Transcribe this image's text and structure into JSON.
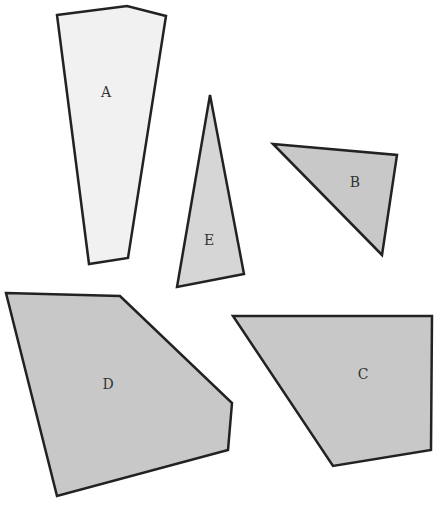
{
  "diagram": {
    "width": 434,
    "height": 509,
    "stroke_color": "#222222",
    "shapes": [
      {
        "label": "A",
        "fill": "#f1f1f1",
        "points": "57,15 127,6 166,16 128,258 89,264",
        "label_x": 106,
        "label_y": 97
      },
      {
        "label": "E",
        "fill": "#d6d6d6",
        "points": "210,95 244,274 177,287",
        "label_x": 209,
        "label_y": 245
      },
      {
        "label": "B",
        "fill": "#c8c8c8",
        "points": "273,144 397,155 382,255",
        "label_x": 355,
        "label_y": 187
      },
      {
        "label": "D",
        "fill": "#c8c8c8",
        "points": "6,293 120,296 232,403 228,450 57,496",
        "label_x": 108,
        "label_y": 389
      },
      {
        "label": "C",
        "fill": "#c8c8c8",
        "points": "233,316 432,316 431,450 333,466",
        "label_x": 363,
        "label_y": 379
      }
    ]
  }
}
